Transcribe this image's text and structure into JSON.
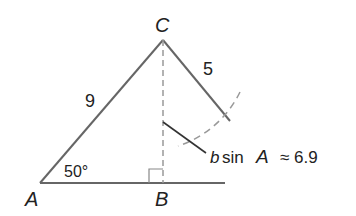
{
  "diagram": {
    "type": "triangle-ambiguous-case",
    "colors": {
      "side": "#666666",
      "dashed": "#999999",
      "text": "#222222",
      "leader": "#333333"
    },
    "vertices": {
      "A": {
        "label": "A",
        "x": 40,
        "y": 183
      },
      "B": {
        "label": "B",
        "x": 163,
        "y": 183
      },
      "C": {
        "label": "C",
        "x": 163,
        "y": 40
      }
    },
    "sides": {
      "AC_label": "9",
      "CA2_label": "5"
    },
    "angle": {
      "label": "50°"
    },
    "altitude": {
      "label_b": "b",
      "label_sin": "sin",
      "label_A": "A",
      "label_approx": "≈ 6.9"
    }
  }
}
